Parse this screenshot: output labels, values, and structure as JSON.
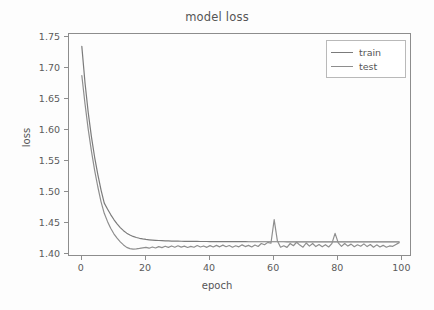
{
  "chart_data": {
    "type": "line",
    "title": "model loss",
    "xlabel": "epoch",
    "ylabel": "loss",
    "xlim": [
      -4,
      103
    ],
    "ylim": [
      1.395,
      1.755
    ],
    "xticks": [
      0,
      20,
      40,
      60,
      80,
      100
    ],
    "xtick_labels": [
      "0",
      "20",
      "40",
      "60",
      "80",
      "100"
    ],
    "yticks": [
      1.4,
      1.45,
      1.5,
      1.55,
      1.6,
      1.65,
      1.7,
      1.75
    ],
    "ytick_labels": [
      "1.40",
      "1.45",
      "1.50",
      "1.55",
      "1.60",
      "1.65",
      "1.70",
      "1.75"
    ],
    "grid": false,
    "legend_position": "upper right",
    "colors": {
      "train": "#7b7b7b",
      "test": "#8e8e8e",
      "axis": "#8d8d8d",
      "text": "#555555",
      "background": "#fdfdfd"
    },
    "x": [
      0,
      1,
      2,
      3,
      4,
      5,
      6,
      7,
      8,
      9,
      10,
      11,
      12,
      13,
      14,
      15,
      16,
      17,
      18,
      19,
      20,
      21,
      22,
      23,
      24,
      25,
      26,
      27,
      28,
      29,
      30,
      31,
      32,
      33,
      34,
      35,
      36,
      37,
      38,
      39,
      40,
      41,
      42,
      43,
      44,
      45,
      46,
      47,
      48,
      49,
      50,
      51,
      52,
      53,
      54,
      55,
      56,
      57,
      58,
      59,
      60,
      61,
      62,
      63,
      64,
      65,
      66,
      67,
      68,
      69,
      70,
      71,
      72,
      73,
      74,
      75,
      76,
      77,
      78,
      79,
      80,
      81,
      82,
      83,
      84,
      85,
      86,
      87,
      88,
      89,
      90,
      91,
      92,
      93,
      94,
      95,
      96,
      97,
      98,
      99
    ],
    "series": [
      {
        "name": "train",
        "values": [
          1.735,
          1.676,
          1.628,
          1.589,
          1.556,
          1.528,
          1.503,
          1.482,
          1.4725,
          1.4635,
          1.4555,
          1.4485,
          1.4425,
          1.4375,
          1.4335,
          1.4305,
          1.4282,
          1.4265,
          1.4252,
          1.4242,
          1.4234,
          1.4228,
          1.4223,
          1.4219,
          1.4216,
          1.4213,
          1.4211,
          1.4209,
          1.4207,
          1.4206,
          1.4205,
          1.4204,
          1.4203,
          1.4202,
          1.4202,
          1.4201,
          1.4201,
          1.42,
          1.42,
          1.42,
          1.4199,
          1.4199,
          1.4199,
          1.4198,
          1.4198,
          1.4198,
          1.4198,
          1.4197,
          1.4197,
          1.4197,
          1.4197,
          1.4197,
          1.4196,
          1.4196,
          1.4196,
          1.4196,
          1.4196,
          1.4196,
          1.4196,
          1.4196,
          1.4196,
          1.4196,
          1.4196,
          1.4196,
          1.4195,
          1.4195,
          1.4195,
          1.4195,
          1.4195,
          1.4195,
          1.4195,
          1.4195,
          1.4195,
          1.4195,
          1.4195,
          1.4195,
          1.4195,
          1.4195,
          1.4195,
          1.4195,
          1.4195,
          1.4195,
          1.4195,
          1.4195,
          1.4195,
          1.4195,
          1.4195,
          1.4195,
          1.4195,
          1.4195,
          1.4195,
          1.4195,
          1.4195,
          1.4195,
          1.4195,
          1.4195,
          1.4195,
          1.4195,
          1.4195,
          1.4195
        ]
      },
      {
        "name": "test",
        "values": [
          1.688,
          1.642,
          1.601,
          1.566,
          1.535,
          1.508,
          1.484,
          1.4655,
          1.4525,
          1.4415,
          1.4325,
          1.4255,
          1.4195,
          1.4145,
          1.4105,
          1.4085,
          1.4078,
          1.4082,
          1.4089,
          1.4098,
          1.4105,
          1.4092,
          1.4112,
          1.4096,
          1.4118,
          1.4102,
          1.4124,
          1.4106,
          1.4128,
          1.4108,
          1.4132,
          1.411,
          1.4126,
          1.4104,
          1.4122,
          1.4108,
          1.4136,
          1.4112,
          1.4128,
          1.4106,
          1.4134,
          1.4112,
          1.4138,
          1.4114,
          1.4142,
          1.4116,
          1.4136,
          1.4108,
          1.4132,
          1.4114,
          1.4146,
          1.4118,
          1.4138,
          1.4112,
          1.4144,
          1.412,
          1.4168,
          1.4148,
          1.4186,
          1.4172,
          1.4552,
          1.4212,
          1.4108,
          1.4132,
          1.4106,
          1.4168,
          1.4132,
          1.4188,
          1.4142,
          1.4108,
          1.4176,
          1.4126,
          1.4168,
          1.4118,
          1.4152,
          1.4114,
          1.4148,
          1.4112,
          1.4166,
          1.4332,
          1.4178,
          1.4122,
          1.4168,
          1.4126,
          1.4158,
          1.4116,
          1.4148,
          1.4124,
          1.4162,
          1.4118,
          1.4152,
          1.4108,
          1.4146,
          1.4112,
          1.4138,
          1.4108,
          1.4128,
          1.4122,
          1.4152,
          1.4182
        ]
      }
    ]
  },
  "legend": {
    "items": [
      {
        "label": "train"
      },
      {
        "label": "test"
      }
    ]
  }
}
